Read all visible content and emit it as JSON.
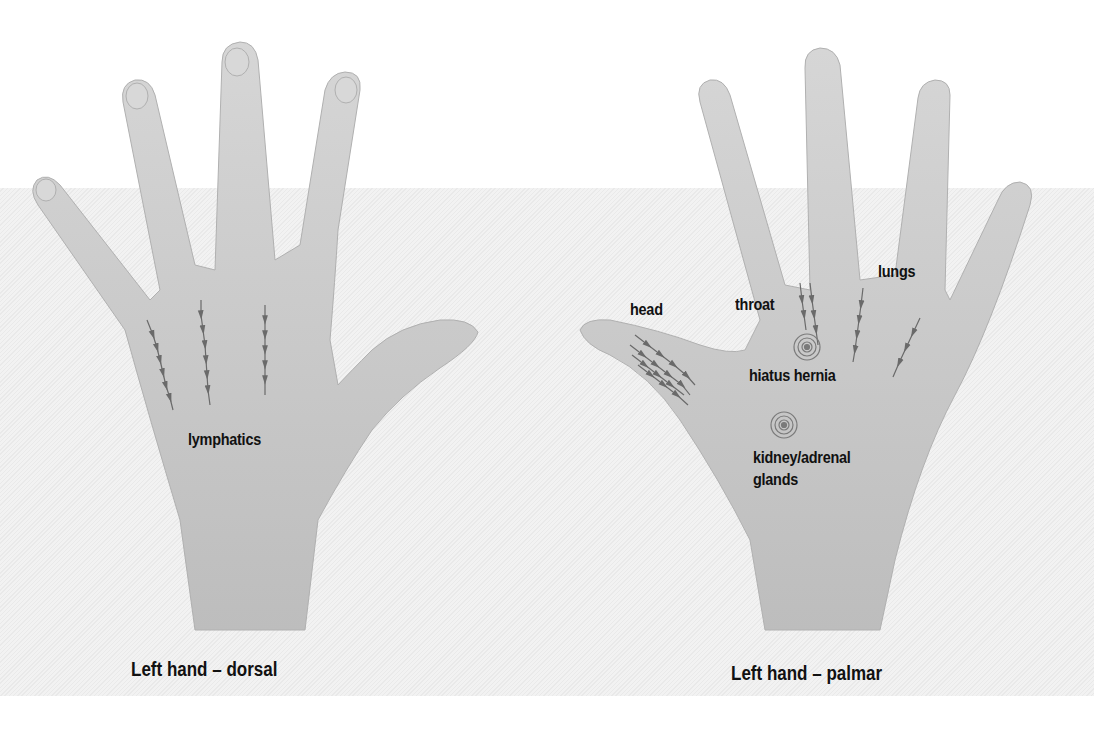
{
  "figure": {
    "left_panel": {
      "caption": "Left hand – dorsal",
      "labels": [
        {
          "id": "lymphatics",
          "text": "lymphatics"
        }
      ]
    },
    "right_panel": {
      "caption": "Left hand – palmar",
      "labels": [
        {
          "id": "head",
          "text": "head"
        },
        {
          "id": "throat",
          "text": "throat"
        },
        {
          "id": "lungs",
          "text": "lungs"
        },
        {
          "id": "hiatus-hernia",
          "text": "hiatus hernia"
        },
        {
          "id": "kidney-adrenal",
          "line1": "kidney/adrenal",
          "line2": "glands"
        }
      ]
    },
    "marker_types": [
      "arrow-line-icon",
      "target-circle-icon"
    ],
    "colors": {
      "background": "#ffffff",
      "band": "#eeeeee",
      "skin": "#c9c9c9",
      "marker": "#6a6a6a",
      "text": "#111111"
    }
  }
}
